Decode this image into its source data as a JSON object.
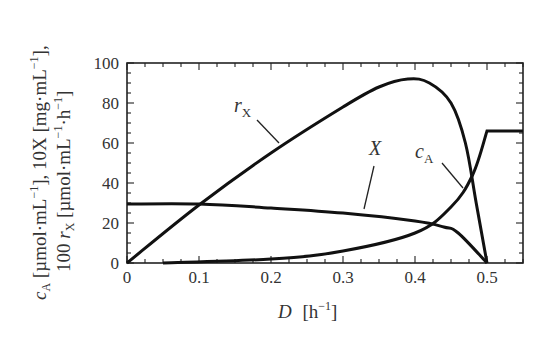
{
  "chart_data": {
    "type": "line",
    "title": "",
    "xlabel": "D (h^-1)",
    "ylabel": "c_A (µmol·mL^-1), 10X (mg·mL^-1), 100 r_X (µmol·mL^-1·h^-1)",
    "xlim": [
      0,
      0.55
    ],
    "ylim": [
      0,
      100
    ],
    "x_ticks": [
      "0",
      "0.1",
      "0.2",
      "0.3",
      "0.4",
      "0.5"
    ],
    "y_ticks": [
      "0",
      "20",
      "40",
      "60",
      "80",
      "100"
    ],
    "grid": false,
    "series": [
      {
        "name": "r_X",
        "x": [
          0,
          0.1,
          0.2,
          0.3,
          0.35,
          0.39,
          0.42,
          0.45,
          0.47,
          0.485,
          0.5
        ],
        "values": [
          0,
          29,
          55,
          78,
          88,
          92,
          90,
          80,
          60,
          30,
          0
        ]
      },
      {
        "name": "X",
        "x": [
          0,
          0.1,
          0.2,
          0.3,
          0.4,
          0.44,
          0.46,
          0.5
        ],
        "values": [
          29.5,
          29.5,
          27.5,
          25,
          21,
          18,
          15,
          0
        ]
      },
      {
        "name": "c_A",
        "x": [
          0.05,
          0.2,
          0.3,
          0.4,
          0.45,
          0.48,
          0.5,
          0.55
        ],
        "values": [
          0,
          2,
          6,
          15,
          28,
          44,
          66,
          66
        ]
      }
    ],
    "annotations": [
      "r_X",
      "X",
      "c_A"
    ]
  },
  "labels": {
    "x_axis_main": "D",
    "x_axis_unit": "[h",
    "x_axis_exp": "−1",
    "x_axis_close": "]",
    "y_line1": "c",
    "y_line1_sub": "A",
    "y_line1_rest": " [µmol·mL",
    "y_line1_exp1": "−1",
    "y_line1_mid": "], 10X [mg·mL",
    "y_line1_exp2": "−1",
    "y_line1_end": "],",
    "y_line2_pre": "100 ",
    "y_line2_r": "r",
    "y_line2_sub": "X",
    "y_line2_rest": " [µmol·mL",
    "y_line2_exp1": "−1",
    "y_line2_mid": "·h",
    "y_line2_exp2": "−1",
    "y_line2_end": "]",
    "rx_label": "r",
    "rx_sub": "X",
    "x_label": "X",
    "ca_label": "c",
    "ca_sub": "A"
  },
  "ticks": {
    "y": [
      {
        "v": "100",
        "y": 63
      },
      {
        "v": "80",
        "y": 103
      },
      {
        "v": "60",
        "y": 143
      },
      {
        "v": "40",
        "y": 183
      },
      {
        "v": "20",
        "y": 223
      },
      {
        "v": "0",
        "y": 263
      }
    ],
    "x": [
      {
        "v": "0",
        "x": 127
      },
      {
        "v": "0.1",
        "x": 199
      },
      {
        "v": "0.2",
        "x": 271
      },
      {
        "v": "0.3",
        "x": 343
      },
      {
        "v": "0.4",
        "x": 415
      },
      {
        "v": "0.5",
        "x": 487
      }
    ]
  }
}
